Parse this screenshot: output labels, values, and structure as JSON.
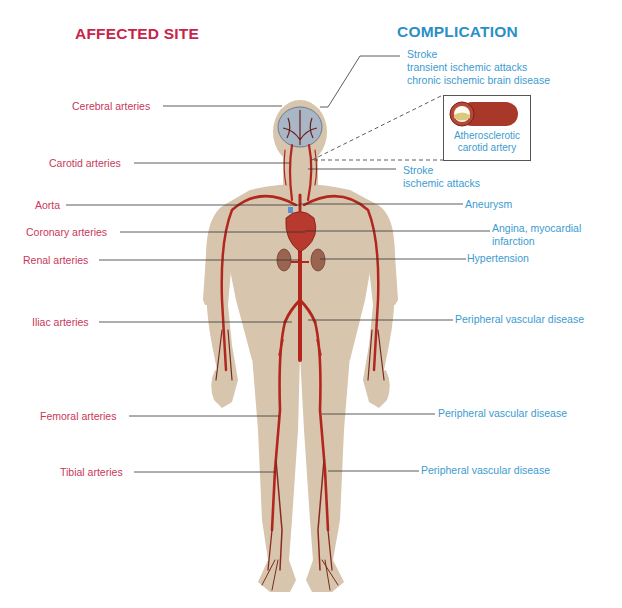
{
  "headings": {
    "affected_site": "AFFECTED SITE",
    "complication": "COMPLICATION"
  },
  "affected_sites": [
    {
      "label": "Cerebral arteries"
    },
    {
      "label": "Carotid arteries"
    },
    {
      "label": "Aorta"
    },
    {
      "label": "Coronary arteries"
    },
    {
      "label": "Renal arteries"
    },
    {
      "label": "Iliac arteries"
    },
    {
      "label": "Femoral arteries"
    },
    {
      "label": "Tibial arteries"
    }
  ],
  "complications": [
    {
      "lines": [
        "Stroke",
        "transient ischemic attacks",
        "chronic ischemic brain disease"
      ]
    },
    {
      "lines": [
        "Stroke",
        "ischemic attacks"
      ]
    },
    {
      "lines": [
        "Aneurysm"
      ]
    },
    {
      "lines": [
        "Angina, myocardial",
        "infarction"
      ]
    },
    {
      "lines": [
        "Hypertension"
      ]
    },
    {
      "lines": [
        "Peripheral vascular disease"
      ]
    },
    {
      "lines": [
        "Peripheral vascular disease"
      ]
    },
    {
      "lines": [
        "Peripheral vascular disease"
      ]
    }
  ],
  "inset": {
    "label_line1": "Atherosclerotic",
    "label_line2": "carotid artery"
  },
  "colors": {
    "affected_site": "#c9385a",
    "complication": "#3c9bd0",
    "body": "#d7c5ad",
    "artery": "#b3261e",
    "leader": "#333333"
  }
}
